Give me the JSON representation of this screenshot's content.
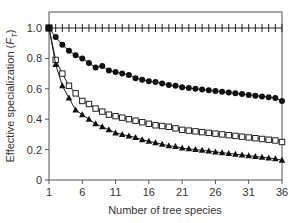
{
  "chart_data": {
    "type": "line",
    "title": "",
    "xlabel": "Number of tree species",
    "ylabel": "Effective specialization (F_T)",
    "ylabel_main": "Effective specialization (",
    "ylabel_sym": "F",
    "ylabel_sub": "T",
    "ylabel_end": ")",
    "xlim": [
      1,
      36
    ],
    "ylim": [
      0,
      1.0
    ],
    "xticks": [
      1,
      6,
      11,
      16,
      21,
      26,
      31,
      36
    ],
    "yticks": [
      0,
      0.2,
      0.4,
      0.6,
      0.8,
      1.0
    ],
    "ytick_labels": [
      "0",
      "0.2",
      "0.4",
      "0.6",
      "0.8",
      "1.0"
    ],
    "grid": false,
    "legend": null,
    "x": [
      1,
      2,
      3,
      4,
      5,
      6,
      7,
      8,
      9,
      10,
      11,
      12,
      13,
      14,
      15,
      16,
      17,
      18,
      19,
      20,
      21,
      22,
      23,
      24,
      25,
      26,
      27,
      28,
      29,
      30,
      31,
      32,
      33,
      34,
      35,
      36
    ],
    "series": [
      {
        "name": "plus",
        "marker": "plus",
        "values": [
          1,
          1,
          1,
          1,
          1,
          1,
          1,
          1,
          1,
          1,
          1,
          1,
          1,
          1,
          1,
          1,
          1,
          1,
          1,
          1,
          1,
          1,
          1,
          1,
          1,
          1,
          1,
          1,
          1,
          1,
          1,
          1,
          1,
          1,
          1,
          1
        ]
      },
      {
        "name": "filled-circle",
        "marker": "circle-filled",
        "values": [
          1.0,
          0.94,
          0.89,
          0.85,
          0.82,
          0.8,
          0.77,
          0.74,
          0.75,
          0.72,
          0.71,
          0.7,
          0.69,
          0.67,
          0.66,
          0.65,
          0.645,
          0.635,
          0.625,
          0.62,
          0.61,
          0.605,
          0.6,
          0.595,
          0.59,
          0.585,
          0.58,
          0.575,
          0.57,
          0.565,
          0.56,
          0.555,
          0.55,
          0.545,
          0.54,
          0.52
        ]
      },
      {
        "name": "open-square",
        "marker": "square-open",
        "values": [
          1.0,
          0.79,
          0.7,
          0.62,
          0.57,
          0.52,
          0.5,
          0.47,
          0.45,
          0.43,
          0.42,
          0.41,
          0.4,
          0.39,
          0.38,
          0.37,
          0.36,
          0.355,
          0.35,
          0.34,
          0.33,
          0.325,
          0.32,
          0.315,
          0.31,
          0.305,
          0.3,
          0.295,
          0.29,
          0.285,
          0.28,
          0.275,
          0.27,
          0.265,
          0.26,
          0.25
        ]
      },
      {
        "name": "filled-triangle",
        "marker": "triangle-filled",
        "values": [
          1.0,
          0.76,
          0.62,
          0.54,
          0.46,
          0.43,
          0.4,
          0.37,
          0.35,
          0.33,
          0.31,
          0.3,
          0.29,
          0.28,
          0.265,
          0.255,
          0.245,
          0.235,
          0.225,
          0.22,
          0.21,
          0.205,
          0.2,
          0.195,
          0.19,
          0.185,
          0.18,
          0.175,
          0.17,
          0.165,
          0.16,
          0.155,
          0.15,
          0.145,
          0.14,
          0.13
        ]
      }
    ]
  }
}
